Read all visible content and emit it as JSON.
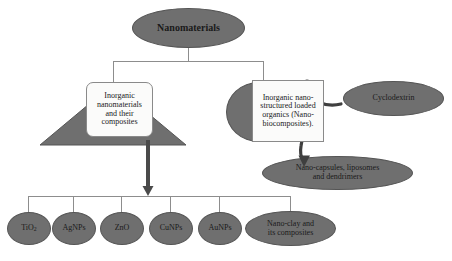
{
  "diagram": {
    "colors": {
      "node_fill": "#6f6f6f",
      "node_stroke": "#555555",
      "box_fill": "#fbfbfa",
      "box_stroke": "#8a8a8a",
      "connector": "#8d8d8d",
      "arrow": "#4a4a4a",
      "background": "#ffffff",
      "text": "#1a1a1a"
    },
    "root": {
      "label": "Nanomaterials"
    },
    "branches": {
      "left": {
        "label_line1": "Inorganic",
        "label_line2": "nanomaterials",
        "label_line3": "and their",
        "label_line4": "composites"
      },
      "right": {
        "label_line1": "Inorganic nano-",
        "label_line2": "structured loaded",
        "label_line3": "organics (Nano-",
        "label_line4": "biocomposites)."
      }
    },
    "side_nodes": {
      "cyclodextrin": "Cyclodextrin",
      "nanocapsules_line1": "Nano-capsules, liposomes",
      "nanocapsules_line2": "and dendrimers"
    },
    "leaves": [
      {
        "label": "TiO",
        "subscript": "2",
        "has_subscript": true,
        "line2": ""
      },
      {
        "label": "AgNPs",
        "subscript": "",
        "has_subscript": false,
        "line2": ""
      },
      {
        "label": "ZnO",
        "subscript": "",
        "has_subscript": false,
        "line2": ""
      },
      {
        "label": "CuNPs",
        "subscript": "",
        "has_subscript": false,
        "line2": ""
      },
      {
        "label": "AuNPs",
        "subscript": "",
        "has_subscript": false,
        "line2": ""
      },
      {
        "label": "Nano-clay and",
        "subscript": "",
        "has_subscript": false,
        "line2": "its composites"
      }
    ]
  }
}
